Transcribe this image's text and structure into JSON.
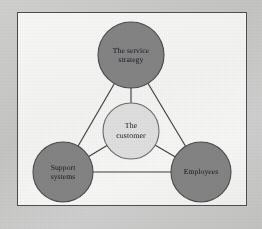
{
  "figure": {
    "type": "concept-diagram",
    "name": "service-triangle",
    "frame": {
      "border_color": "#4e4e50",
      "panel_color": "#f4f4f3",
      "margin_color": "#c8c8c6"
    },
    "style": {
      "outer_node_fill": "#838383",
      "outer_node_stroke": "#4a4a4a",
      "center_node_fill": "#dedede",
      "center_node_stroke": "#6b6b6b",
      "connector_color": "#3f3f44",
      "text_color": "#15151f"
    }
  },
  "nodes": [
    {
      "id": "service-strategy",
      "label": "The service\nstrategy",
      "line1": "The service",
      "line2": "strategy",
      "role": "outer",
      "position": "top",
      "cx": 114,
      "cy": 43,
      "r": 33,
      "fill": "#838383"
    },
    {
      "id": "support-systems",
      "label": "Support\nsystems",
      "line1": "Support",
      "line2": "systems",
      "role": "outer",
      "position": "bottom-left",
      "cx": 46,
      "cy": 160,
      "r": 30,
      "fill": "#838383"
    },
    {
      "id": "employees",
      "label": "Employees",
      "line1": "Employees",
      "line2": "",
      "role": "outer",
      "position": "bottom-right",
      "cx": 184,
      "cy": 160,
      "r": 30,
      "fill": "#838383"
    },
    {
      "id": "customer",
      "label": "The\ncustomer",
      "line1": "The",
      "line2": "customer",
      "role": "center",
      "position": "center",
      "cx": 114,
      "cy": 119,
      "r": 28,
      "fill": "#dedede"
    }
  ],
  "edges": [
    {
      "id": "edge-strategy-support",
      "from": "service-strategy",
      "to": "support-systems",
      "kind": "outer-triangle"
    },
    {
      "id": "edge-strategy-employees",
      "from": "service-strategy",
      "to": "employees",
      "kind": "outer-triangle"
    },
    {
      "id": "edge-support-employees",
      "from": "support-systems",
      "to": "employees",
      "kind": "outer-triangle"
    },
    {
      "id": "edge-strategy-customer",
      "from": "service-strategy",
      "to": "customer",
      "kind": "spoke"
    },
    {
      "id": "edge-support-customer",
      "from": "support-systems",
      "to": "customer",
      "kind": "spoke"
    },
    {
      "id": "edge-employees-customer",
      "from": "employees",
      "to": "customer",
      "kind": "spoke"
    }
  ]
}
